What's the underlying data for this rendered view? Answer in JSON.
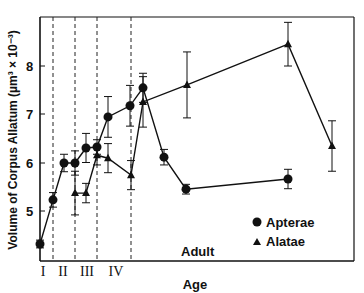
{
  "chart_data": {
    "type": "line",
    "title": "",
    "xlabel": "Age",
    "ylabel": "Volume of Corpus Allatum (µm³ × 10⁻³)",
    "y_ticks": [
      "5",
      "6",
      "7",
      "8"
    ],
    "ylim": [
      4.1,
      9.0
    ],
    "x_stage_labels": [
      "I",
      "II",
      "III",
      "IV"
    ],
    "x_region_label": "Adult",
    "legend": [
      {
        "name": "Apterae",
        "marker": "circle"
      },
      {
        "name": "Alatae",
        "marker": "triangle"
      }
    ],
    "legend_position": "lower right",
    "grid": false,
    "series": [
      {
        "name": "Apterae",
        "marker": "circle",
        "points": [
          {
            "x": 40,
            "y": 4.33,
            "err": 0.08
          },
          {
            "x": 53,
            "y": 5.24,
            "err": 0.15
          },
          {
            "x": 64,
            "y": 6.0,
            "err": 0.18
          },
          {
            "x": 75,
            "y": 6.0,
            "err": 0.25
          },
          {
            "x": 86,
            "y": 6.31,
            "err": 0.3
          },
          {
            "x": 97,
            "y": 6.33,
            "err": 0.15
          },
          {
            "x": 108,
            "y": 6.95,
            "err": 0.42
          },
          {
            "x": 130,
            "y": 7.18,
            "err": 0.42
          },
          {
            "x": 143,
            "y": 7.55,
            "err": 0.3
          },
          {
            "x": 164,
            "y": 6.12,
            "err": 0.16
          },
          {
            "x": 186,
            "y": 5.46,
            "err": 0.1
          },
          {
            "x": 288,
            "y": 5.67,
            "err": 0.2
          }
        ]
      },
      {
        "name": "Alatae",
        "marker": "triangle",
        "points": [
          {
            "x": 75,
            "y": 5.38,
            "err": 0.45
          },
          {
            "x": 86,
            "y": 5.38,
            "err": 0.2
          },
          {
            "x": 97,
            "y": 6.16,
            "err": 0.2
          },
          {
            "x": 108,
            "y": 6.1,
            "err": 0.3
          },
          {
            "x": 131,
            "y": 5.75,
            "err": 0.3
          },
          {
            "x": 143,
            "y": 7.26,
            "err": 0.52
          },
          {
            "x": 187,
            "y": 7.61,
            "err": 0.68
          },
          {
            "x": 288,
            "y": 8.45,
            "err": 0.45
          },
          {
            "x": 332,
            "y": 6.35,
            "err": 0.52
          }
        ]
      }
    ],
    "stage_boundaries_px": [
      53,
      75,
      97,
      131
    ]
  },
  "labels": {
    "ylabel": "Volume of Corpus Allatum (µm³ × 10⁻³)",
    "xlabel": "Age",
    "adult": "Adult",
    "legend_apterae": "Apterae",
    "legend_alatae": "Alatae",
    "stage_1": "I",
    "stage_2": "II",
    "stage_3": "III",
    "stage_4": "IV",
    "tick_5": "5",
    "tick_6": "6",
    "tick_7": "7",
    "tick_8": "8"
  }
}
